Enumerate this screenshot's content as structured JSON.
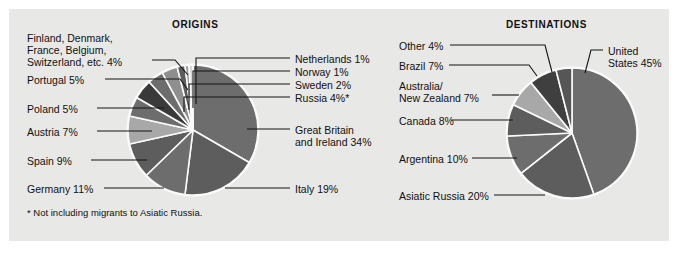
{
  "figure": {
    "background_color": "#e8e8e6",
    "footnote": "* Not including migrants to Asiatic Russia."
  },
  "charts": {
    "origins": {
      "title": "ORIGINS",
      "labels": {
        "great_britain": "Great Britain\nand Ireland 34%",
        "great_britain_line1": "Great Britain",
        "great_britain_line2": "and Ireland 34%",
        "italy": "Italy 19%",
        "germany": "Germany 11%",
        "spain": "Spain 9%",
        "austria": "Austria 7%",
        "poland": "Poland 5%",
        "portugal": "Portugal 5%",
        "misc_line1": "Finland, Denmark,",
        "misc_line2": "France, Belgium,",
        "misc_line3": "Switzerland, etc. 4%",
        "russia": "Russia 4%*",
        "sweden": "Sweden 2%",
        "norway": "Norway 1%",
        "netherlands": "Netherlands 1%"
      }
    },
    "destinations": {
      "title": "DESTINATIONS",
      "labels": {
        "united_states_line1": "United",
        "united_states_line2": "States 45%",
        "asiatic_russia": "Asiatic Russia 20%",
        "argentina": "Argentina 10%",
        "canada": "Canada 8%",
        "australia_line1": "Australia/",
        "australia_line2": "New Zealand 7%",
        "brazil": "Brazil 7%",
        "other": "Other 4%"
      }
    }
  },
  "chart_data": [
    {
      "type": "pie",
      "title": "ORIGINS",
      "unit": "percent",
      "note": "* Not including migrants to Asiatic Russia.",
      "start_angle_deg": -90,
      "direction": "clockwise",
      "categories": [
        "Great Britain and Ireland",
        "Italy",
        "Germany",
        "Spain",
        "Austria",
        "Poland",
        "Portugal",
        "Finland, Denmark, France, Belgium, Switzerland, etc.",
        "Russia",
        "Sweden",
        "Norway",
        "Netherlands"
      ],
      "values": [
        34,
        19,
        11,
        9,
        7,
        5,
        5,
        4,
        4,
        2,
        1,
        1
      ],
      "colors": [
        "#6d6d6d",
        "#5d5d5d",
        "#6d6d6d",
        "#5d5d5d",
        "#a8a8a8",
        "#6d6d6d",
        "#3a3a3a",
        "#6d6d6d",
        "#8f8f8f",
        "#5d5d5d",
        "#9d9d9d",
        "#d6d6d6"
      ]
    },
    {
      "type": "pie",
      "title": "DESTINATIONS",
      "unit": "percent",
      "start_angle_deg": -90,
      "direction": "clockwise",
      "categories": [
        "United States",
        "Asiatic Russia",
        "Argentina",
        "Canada",
        "Australia/New Zealand",
        "Brazil",
        "Other"
      ],
      "values": [
        45,
        20,
        10,
        8,
        7,
        7,
        4
      ],
      "colors": [
        "#6d6d6d",
        "#5d5d5d",
        "#6d6d6d",
        "#5d5d5d",
        "#a8a8a8",
        "#3f3f3f",
        "#565656"
      ]
    }
  ]
}
